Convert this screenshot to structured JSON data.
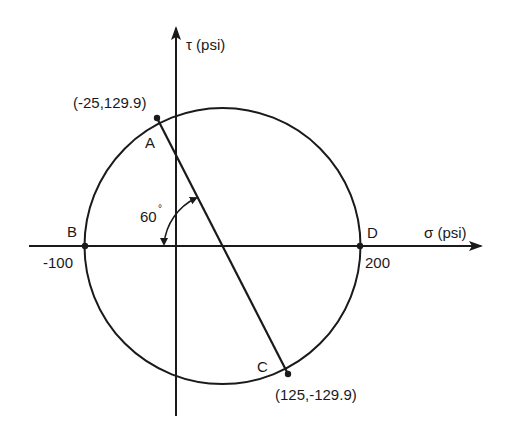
{
  "diagram": {
    "axes": {
      "sigma": {
        "label": "σ (psi)",
        "symbol": "σ",
        "unit": "(psi)"
      },
      "tau": {
        "label": "τ (psi)",
        "symbol": "τ",
        "unit": "(psi)"
      }
    },
    "points": {
      "A": {
        "name": "A",
        "coords": "(-25,129.9)",
        "sigma": -25,
        "tau": 129.9
      },
      "B": {
        "name": "B",
        "value": "-100",
        "sigma": -100,
        "tau": 0
      },
      "C": {
        "name": "C",
        "coords": "(125,-129.9)",
        "sigma": 125,
        "tau": -129.9
      },
      "D": {
        "name": "D",
        "value": "200",
        "sigma": 200,
        "tau": 0
      }
    },
    "angle": {
      "value": "60",
      "degree_symbol": "°",
      "label": "60°"
    },
    "circle": {
      "center_sigma": 50,
      "radius": 150
    },
    "colors": {
      "line": "#1a1a1a",
      "background": "#ffffff"
    }
  }
}
